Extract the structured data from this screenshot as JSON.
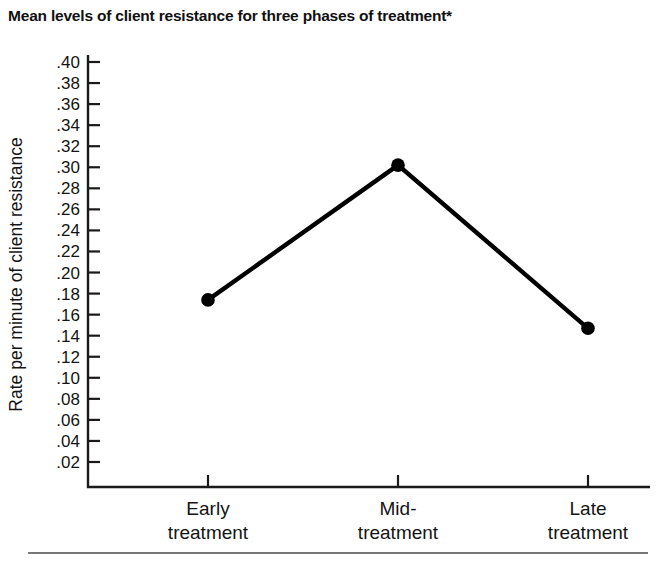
{
  "chart_data": {
    "type": "line",
    "title": "Mean levels of client resistance for three phases of treatment*",
    "xlabel": "",
    "ylabel": "Rate per minute of client resistance",
    "categories": [
      "Early treatment",
      "Mid-treatment",
      "Late treatment"
    ],
    "category_lines": [
      [
        "Early",
        "treatment"
      ],
      [
        "Mid-",
        "treatment"
      ],
      [
        "Late",
        "treatment"
      ]
    ],
    "values": [
      0.174,
      0.302,
      0.147
    ],
    "ylim": [
      0.0,
      0.41
    ],
    "ytick_values": [
      0.4,
      0.38,
      0.36,
      0.34,
      0.32,
      0.3,
      0.28,
      0.26,
      0.24,
      0.22,
      0.2,
      0.18,
      0.16,
      0.14,
      0.12,
      0.1,
      0.08,
      0.06,
      0.04,
      0.02
    ],
    "ytick_labels": [
      ".40",
      ".38",
      ".36",
      ".34",
      ".32",
      ".30",
      ".28",
      ".26",
      ".24",
      ".22",
      ".20",
      ".18",
      ".16",
      ".14",
      ".12",
      ".10",
      ".08",
      ".06",
      ".04",
      ".02"
    ],
    "grid": false,
    "legend": null,
    "marker": "filled-circle",
    "line_color": "#000000",
    "marker_color": "#000000"
  },
  "figure": {
    "footnote_marker": "*"
  }
}
